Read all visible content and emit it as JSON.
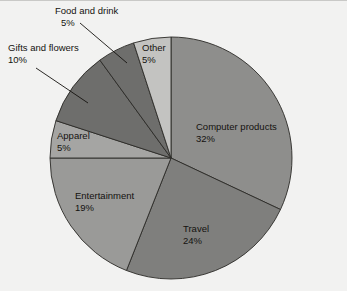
{
  "figure": {
    "name": "pie-chart-figure",
    "background_color": "#f2f2f1",
    "border_color": "#c9c9c7"
  },
  "chart_data": {
    "type": "pie",
    "title": "",
    "subtitle": "",
    "xlabel": "",
    "ylabel": "",
    "legend_position": "none",
    "grid": false,
    "start_angle_deg": 90,
    "direction": "clockwise",
    "units": "percent",
    "total": 100,
    "categories": [
      "Computer products",
      "Travel",
      "Entertainment",
      "Apparel",
      "Gifts and flowers",
      "Food and drink",
      "Other"
    ],
    "values": [
      32,
      24,
      19,
      5,
      10,
      5,
      5
    ],
    "slices": [
      {
        "label": "Computer products",
        "value": 32,
        "value_text": "32%",
        "color": "#8e8e8c",
        "label_placement": "inside",
        "label_x": 196,
        "label_y": 129,
        "value_x": 196,
        "value_y": 141
      },
      {
        "label": "Travel",
        "value": 24,
        "value_text": "24%",
        "color": "#7f7f7d",
        "label_placement": "inside",
        "label_x": 183,
        "label_y": 231,
        "value_x": 183,
        "value_y": 243
      },
      {
        "label": "Entertainment",
        "value": 19,
        "value_text": "19%",
        "color": "#9a9a98",
        "label_placement": "inside",
        "label_x": 75,
        "label_y": 198,
        "value_x": 75,
        "value_y": 210
      },
      {
        "label": "Apparel",
        "value": 5,
        "value_text": "5%",
        "color": "#a5a5a3",
        "label_placement": "inside",
        "label_x": 57,
        "label_y": 138,
        "value_x": 57,
        "value_y": 150
      },
      {
        "label": "Gifts and flowers",
        "value": 10,
        "value_text": "10%",
        "color": "#6e6e6c",
        "label_placement": "callout",
        "label_x": 8,
        "label_y": 50,
        "value_x": 8,
        "value_y": 62,
        "leader_x1": 36,
        "leader_y1": 67,
        "leader_x2": 88,
        "leader_y2": 102
      },
      {
        "label": "Food and drink",
        "value": 5,
        "value_text": "5%",
        "color": "#6e6e6c",
        "label_placement": "callout",
        "label_x": 55,
        "label_y": 13,
        "value_x": 61,
        "value_y": 25,
        "leader_x1": 80,
        "leader_y1": 22,
        "leader_x2": 127,
        "leader_y2": 62
      },
      {
        "label": "Other",
        "value": 5,
        "value_text": "5%",
        "color": "#c3c3c1",
        "label_placement": "inside",
        "label_x": 142,
        "label_y": 50,
        "value_x": 142,
        "value_y": 62
      }
    ],
    "geometry": {
      "center_x": 171,
      "center_y": 157,
      "radius": 121
    },
    "edge_color": "#2b2a27"
  }
}
